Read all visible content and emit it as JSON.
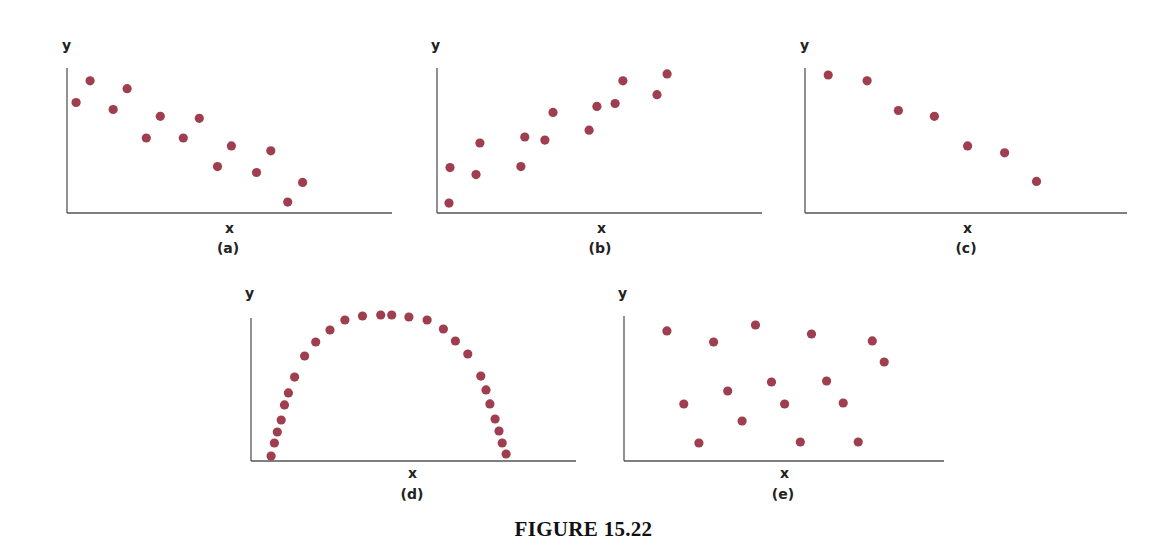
{
  "figure": {
    "caption": "FIGURE 15.22",
    "dot_color": "#9e3e4e",
    "axis_color": "#555555"
  },
  "chart_data": [
    {
      "type": "scatter",
      "title": "(a)",
      "xlabel": "x",
      "ylabel": "y",
      "grid": false,
      "xlim": [
        0,
        100
      ],
      "ylim": [
        0,
        100
      ],
      "description": "moderate negative linear correlation",
      "points": [
        [
          2.8,
          76.2
        ],
        [
          7.1,
          91.2
        ],
        [
          14.2,
          71.4
        ],
        [
          18.5,
          85.7
        ],
        [
          24.4,
          51.7
        ],
        [
          28.7,
          66.7
        ],
        [
          35.8,
          51.7
        ],
        [
          40.7,
          65.3
        ],
        [
          46.3,
          32.0
        ],
        [
          50.6,
          46.3
        ],
        [
          58.3,
          27.9
        ],
        [
          62.7,
          42.9
        ],
        [
          67.9,
          7.5
        ],
        [
          72.5,
          21.1
        ]
      ]
    },
    {
      "type": "scatter",
      "title": "(b)",
      "xlabel": "x",
      "ylabel": "y",
      "grid": false,
      "xlim": [
        0,
        100
      ],
      "ylim": [
        0,
        100
      ],
      "description": "moderate positive linear correlation",
      "points": [
        [
          3.7,
          6.8
        ],
        [
          4.0,
          31.3
        ],
        [
          12.0,
          26.5
        ],
        [
          13.2,
          48.3
        ],
        [
          25.8,
          32.0
        ],
        [
          27.0,
          52.4
        ],
        [
          33.2,
          50.3
        ],
        [
          35.7,
          69.4
        ],
        [
          46.8,
          57.1
        ],
        [
          49.2,
          73.5
        ],
        [
          54.8,
          75.5
        ],
        [
          57.2,
          91.2
        ],
        [
          67.7,
          81.6
        ],
        [
          70.8,
          95.9
        ]
      ]
    },
    {
      "type": "scatter",
      "title": "(c)",
      "xlabel": "x",
      "ylabel": "y",
      "grid": false,
      "xlim": [
        0,
        100
      ],
      "ylim": [
        0,
        100
      ],
      "description": "strong negative linear correlation",
      "points": [
        [
          7.2,
          95.2
        ],
        [
          19.3,
          91.2
        ],
        [
          29.0,
          70.7
        ],
        [
          40.2,
          66.7
        ],
        [
          50.5,
          46.3
        ],
        [
          62.0,
          41.5
        ],
        [
          71.9,
          21.8
        ]
      ]
    },
    {
      "type": "scatter",
      "title": "(d)",
      "xlabel": "x",
      "ylabel": "y",
      "grid": false,
      "xlim": [
        0,
        100
      ],
      "ylim": [
        0,
        100
      ],
      "description": "nonlinear (inverted-U / semicircular) relationship",
      "points": [
        [
          6.2,
          3.5
        ],
        [
          7.2,
          12.6
        ],
        [
          8.1,
          20.3
        ],
        [
          9.3,
          28.7
        ],
        [
          10.3,
          39.2
        ],
        [
          11.5,
          47.6
        ],
        [
          13.4,
          58.7
        ],
        [
          16.5,
          73.4
        ],
        [
          19.9,
          83.2
        ],
        [
          24.3,
          91.6
        ],
        [
          28.9,
          98.6
        ],
        [
          34.3,
          101.4
        ],
        [
          39.9,
          102.1
        ],
        [
          43.3,
          102.1
        ],
        [
          48.6,
          100.7
        ],
        [
          54.2,
          98.6
        ],
        [
          59.2,
          92.3
        ],
        [
          62.9,
          83.9
        ],
        [
          66.7,
          74.8
        ],
        [
          70.7,
          59.4
        ],
        [
          72.3,
          49.7
        ],
        [
          73.5,
          39.9
        ],
        [
          75.1,
          29.4
        ],
        [
          76.3,
          21.0
        ],
        [
          77.3,
          12.6
        ],
        [
          78.5,
          4.9
        ]
      ]
    },
    {
      "type": "scatter",
      "title": "(e)",
      "xlabel": "x",
      "ylabel": "y",
      "grid": false,
      "xlim": [
        0,
        100
      ],
      "ylim": [
        0,
        100
      ],
      "description": "no correlation",
      "points": [
        [
          13.4,
          89.7
        ],
        [
          28.0,
          82.1
        ],
        [
          41.1,
          93.8
        ],
        [
          58.6,
          87.6
        ],
        [
          77.6,
          82.8
        ],
        [
          81.3,
          68.3
        ],
        [
          18.7,
          39.3
        ],
        [
          32.4,
          48.3
        ],
        [
          46.1,
          54.5
        ],
        [
          50.2,
          39.3
        ],
        [
          63.3,
          55.2
        ],
        [
          68.5,
          40.0
        ],
        [
          36.9,
          27.6
        ],
        [
          23.4,
          12.4
        ],
        [
          55.1,
          13.1
        ],
        [
          73.2,
          13.1
        ]
      ]
    }
  ],
  "panels_layout": [
    {
      "ox": 67,
      "oy": 213,
      "w": 325,
      "h": 145,
      "ylabel_x": 62,
      "ylabel_y": 38,
      "xlabel_x": 225,
      "xlabel_y": 221,
      "plabel_x": 228,
      "plabel_y": 241
    },
    {
      "ox": 437,
      "oy": 213,
      "w": 325,
      "h": 145,
      "ylabel_x": 431,
      "ylabel_y": 38,
      "xlabel_x": 597,
      "xlabel_y": 221,
      "plabel_x": 600,
      "plabel_y": 241
    },
    {
      "ox": 805,
      "oy": 213,
      "w": 322,
      "h": 145,
      "ylabel_x": 800,
      "ylabel_y": 38,
      "xlabel_x": 963,
      "xlabel_y": 221,
      "plabel_x": 966,
      "plabel_y": 241
    },
    {
      "ox": 251,
      "oy": 461,
      "w": 325,
      "h": 143,
      "ylabel_x": 245,
      "ylabel_y": 286,
      "xlabel_x": 408,
      "xlabel_y": 466,
      "plabel_x": 412,
      "plabel_y": 487
    },
    {
      "ox": 624,
      "oy": 461,
      "w": 320,
      "h": 145,
      "ylabel_x": 618,
      "ylabel_y": 286,
      "xlabel_x": 780,
      "xlabel_y": 466,
      "plabel_x": 783,
      "plabel_y": 487
    }
  ]
}
